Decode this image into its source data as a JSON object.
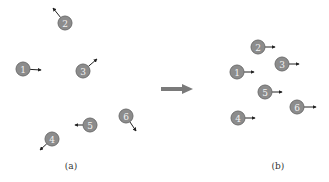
{
  "figure": {
    "panels": [
      {
        "id": "a",
        "caption": "(a)",
        "caption_pos": [
          71,
          169
        ],
        "nodes": [
          {
            "label": "1",
            "cx": 23,
            "cy": 69,
            "arrow_to": [
              41,
              70
            ]
          },
          {
            "label": "2",
            "cx": 65,
            "cy": 23,
            "arrow_to": [
              53,
              8
            ]
          },
          {
            "label": "3",
            "cx": 83,
            "cy": 71,
            "arrow_to": [
              97,
              59
            ]
          },
          {
            "label": "4",
            "cx": 52,
            "cy": 139,
            "arrow_to": [
              40,
              150
            ]
          },
          {
            "label": "5",
            "cx": 90,
            "cy": 125,
            "arrow_to": [
              75,
              125
            ]
          },
          {
            "label": "6",
            "cx": 126,
            "cy": 116,
            "arrow_to": [
              136,
              131
            ]
          }
        ]
      },
      {
        "id": "b",
        "caption": "(b)",
        "caption_pos": [
          278,
          169
        ],
        "nodes": [
          {
            "label": "1",
            "cx": 237,
            "cy": 72,
            "arrow_to": [
              254,
              72
            ]
          },
          {
            "label": "2",
            "cx": 258,
            "cy": 47,
            "arrow_to": [
              275,
              47
            ]
          },
          {
            "label": "3",
            "cx": 282,
            "cy": 64,
            "arrow_to": [
              299,
              64
            ]
          },
          {
            "label": "4",
            "cx": 238,
            "cy": 118,
            "arrow_to": [
              255,
              118
            ]
          },
          {
            "label": "5",
            "cx": 265,
            "cy": 92,
            "arrow_to": [
              282,
              92
            ]
          },
          {
            "label": "6",
            "cx": 297,
            "cy": 107,
            "arrow_to": [
              316,
              107
            ]
          }
        ]
      }
    ],
    "transition_arrow": {
      "x1": 161,
      "x2": 193,
      "y": 89,
      "color": "#7a7a7a"
    },
    "colors": {
      "node_fill": "#8c8c8c",
      "node_stroke": "#6e6e6e",
      "label": "#f2f2f2",
      "arrow": "#222222"
    }
  }
}
